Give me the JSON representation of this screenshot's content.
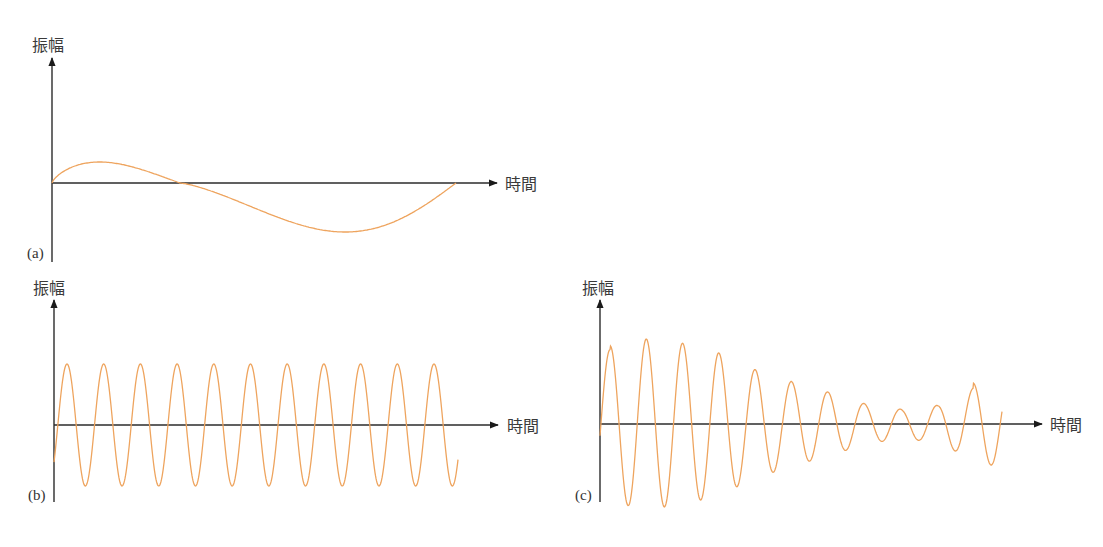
{
  "colors": {
    "wave": "#EEA45E",
    "axis": "#2b2b2b",
    "text": "#3a3a3a"
  },
  "panels": [
    {
      "id": "a",
      "label": "(a)",
      "ylabel": "振幅",
      "xlabel": "時間"
    },
    {
      "id": "b",
      "label": "(b)",
      "ylabel": "振幅",
      "xlabel": "時間"
    },
    {
      "id": "c",
      "label": "(c)",
      "ylabel": "振幅",
      "xlabel": "時間"
    }
  ],
  "chart_data": [
    {
      "type": "line",
      "panel": "(a)",
      "title": "",
      "xlabel": "時間",
      "ylabel": "振幅",
      "description": "Single slow cycle (low frequency) sine wave, ~1 period across the time axis",
      "series": [
        {
          "name": "wave",
          "cycles": 1.0,
          "amplitude_rel": [
            0.45,
            -1.0
          ],
          "x_start_px": 52,
          "x_end_px": 456
        }
      ],
      "grid": false,
      "ticks": false
    },
    {
      "type": "line",
      "panel": "(b)",
      "title": "",
      "xlabel": "時間",
      "ylabel": "振幅",
      "description": "Constant-amplitude high-frequency sine wave, 11 cycles",
      "series": [
        {
          "name": "wave",
          "cycles": 11,
          "amplitude_rel": 1.0,
          "x_start_px": 54,
          "x_end_px": 458
        }
      ],
      "grid": false,
      "ticks": false
    },
    {
      "type": "line",
      "panel": "(c)",
      "title": "",
      "xlabel": "時間",
      "ylabel": "振幅",
      "description": "Amplitude-varying (modulated) wave: amplitude decays then grows slightly at end, ~11 cycles",
      "series": [
        {
          "name": "wave",
          "cycles": 11,
          "peak_amplitudes_rel": [
            0.92,
            1.0,
            0.95,
            0.84,
            0.63,
            0.49,
            0.37,
            0.23,
            0.17,
            0.22,
            0.42
          ],
          "x_start_px": 600,
          "x_end_px": 1002
        }
      ],
      "grid": false,
      "ticks": false
    }
  ]
}
